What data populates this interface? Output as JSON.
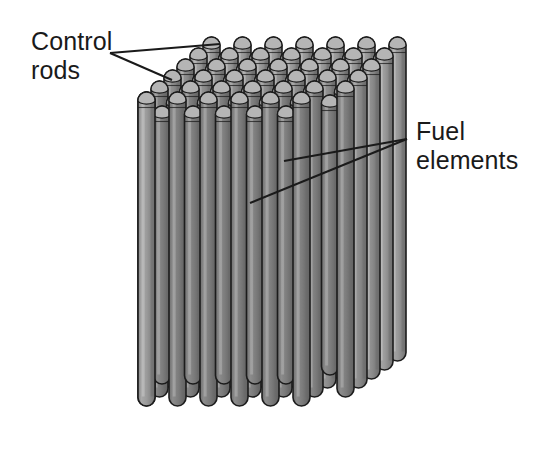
{
  "figure": {
    "background_color": "#ffffff"
  },
  "labels": {
    "control_rods": "Control\nrods",
    "fuel_elements": "Fuel\nelements"
  },
  "colors": {
    "rod_fill_front": "#9b9b9b",
    "rod_fill_mid": "#8e8e8e",
    "rod_fill_back": "#7d7d7d",
    "rod_outline": "#1c1c1c",
    "rod_highlight": "#c9c9c9",
    "rod_shadow": "#6a6a6a",
    "cap_top": "#b5b5b5",
    "leader_line": "#1a1a1a",
    "text": "#1a1a1a",
    "background": "#ffffff"
  },
  "geometry": {
    "rod_width": 17,
    "rod_columns": 7,
    "rod_rows": 6,
    "column_pitch_x": 31,
    "row_offset_x": 13,
    "row_offset_y": -11,
    "front_row_top_y": 92,
    "front_row_left_x": 138,
    "front_rod_bottom_y": 406,
    "bottom_step_y": 9
  },
  "leaders": {
    "control_rods": {
      "vertex": [
        110,
        53
      ],
      "endpoints": [
        [
          220,
          44
        ],
        [
          172,
          80
        ]
      ]
    },
    "fuel_elements": {
      "vertex": [
        407,
        139
      ],
      "endpoints": [
        [
          284,
          161
        ],
        [
          250,
          203
        ]
      ]
    }
  }
}
